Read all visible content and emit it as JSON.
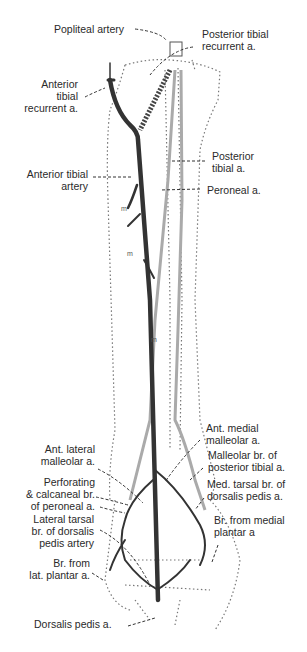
{
  "labels": {
    "popliteal": "Popliteal artery",
    "post_tib_rec_1": "Posterior tibial",
    "post_tib_rec_2": "recurrent a.",
    "ant_tib_rec_1": "Anterior",
    "ant_tib_rec_2": "tibial",
    "ant_tib_rec_3": "recurrent a.",
    "ant_tib_1": "Anterior tibial",
    "ant_tib_2": "artery",
    "post_tib_1": "Posterior",
    "post_tib_2": "tibial a.",
    "peroneal": "Peroneal a.",
    "ant_med_mall_1": "Ant. medial",
    "ant_med_mall_2": "malleolar a.",
    "ant_lat_mall_1": "Ant. lateral",
    "ant_lat_mall_2": "malleolar a.",
    "mall_post_tib_1": "Malleolar br. of",
    "mall_post_tib_2": "posterior tibial a.",
    "perf_1": "Perforating",
    "perf_2": "& calcaneal br.",
    "perf_3": "of peroneal a.",
    "med_tarsal_1": "Med. tarsal br. of",
    "med_tarsal_2": "dorsalis pedis a.",
    "lat_tarsal_1": "Lateral tarsal",
    "lat_tarsal_2": "br. of dorsalis",
    "lat_tarsal_3": "pedis artery",
    "med_plantar_1": "Br. from medial",
    "med_plantar_2": "plantar a",
    "lat_plantar_1": "Br. from",
    "lat_plantar_2": "lat. plantar a.",
    "dorsalis": "Dorsalis pedis a.",
    "muscle_marker": "m"
  }
}
